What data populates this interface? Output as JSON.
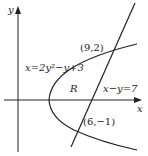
{
  "axes": {
    "x_label": "x",
    "y_label": "y"
  },
  "curves": {
    "parabola_label": "x=2y²−y+3",
    "line_label": "x−y=7"
  },
  "points": {
    "upper": "(9,2)",
    "lower": "(6,−1)"
  },
  "region_label": "R"
}
